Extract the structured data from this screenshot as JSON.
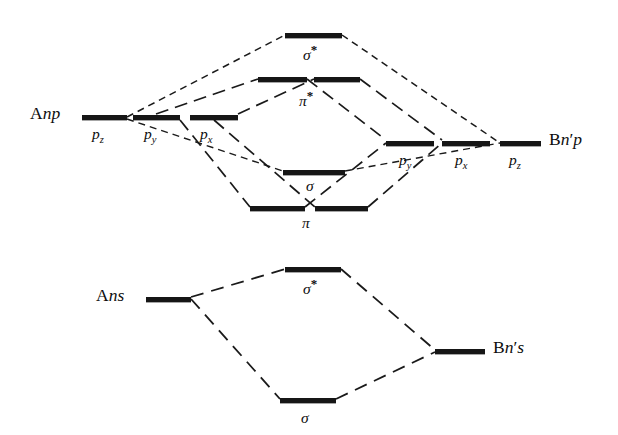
{
  "figure": {
    "type": "molecular-orbital-energy-level-diagram"
  },
  "diagram_p": {
    "left_atom_label": {
      "element": "A",
      "orbital": "np"
    },
    "right_atom_label": {
      "element": "B",
      "orbital": "n'p"
    },
    "left_orbitals": [
      {
        "name": "p_z",
        "label": "p",
        "sub": "z"
      },
      {
        "name": "p_y",
        "label": "p",
        "sub": "y"
      },
      {
        "name": "p_x",
        "label": "p",
        "sub": "x"
      }
    ],
    "right_orbitals": [
      {
        "name": "p_y",
        "label": "p",
        "sub": "y"
      },
      {
        "name": "p_x",
        "label": "p",
        "sub": "x"
      },
      {
        "name": "p_z",
        "label": "p",
        "sub": "z"
      }
    ],
    "molecular_orbitals": [
      {
        "name": "sigma-star",
        "label": "σ",
        "star": "*",
        "degeneracy": 1
      },
      {
        "name": "pi-star",
        "label": "π",
        "star": "*",
        "degeneracy": 2
      },
      {
        "name": "sigma",
        "label": "σ",
        "star": "",
        "degeneracy": 1
      },
      {
        "name": "pi",
        "label": "π",
        "star": "",
        "degeneracy": 2
      }
    ]
  },
  "diagram_s": {
    "left_atom_label": {
      "element": "A",
      "orbital": "ns"
    },
    "right_atom_label": {
      "element": "B",
      "orbital": "n's"
    },
    "molecular_orbitals": [
      {
        "name": "sigma-star",
        "label": "σ",
        "star": "*"
      },
      {
        "name": "sigma",
        "label": "σ",
        "star": ""
      }
    ]
  },
  "text": {
    "A": "A",
    "B": "B",
    "np": "np",
    "n_prime_p": "n",
    "n_prime_p_tail": "p",
    "ns": "ns",
    "n_prime_s_tail": "s",
    "prime": "′",
    "p": "p",
    "sub_x": "x",
    "sub_y": "y",
    "sub_z": "z",
    "sigma": "σ",
    "pi": "π",
    "star": "*"
  },
  "colors": {
    "level_bar": "#161616",
    "line": "#1a1a1a",
    "background": "#ffffff",
    "text": "#0d0d0d"
  },
  "geometry": {
    "width": 618,
    "height": 435,
    "p_levels": {
      "A_pz": {
        "x": 82,
        "y": 115,
        "w": 45
      },
      "A_py": {
        "x": 133,
        "y": 115,
        "w": 47
      },
      "A_px": {
        "x": 190,
        "y": 115,
        "w": 48
      },
      "sigma_star": {
        "x": 285,
        "y": 33,
        "w": 57
      },
      "pi_star_a": {
        "x": 258,
        "y": 77,
        "w": 49
      },
      "pi_star_b": {
        "x": 314,
        "y": 77,
        "w": 46
      },
      "sigma": {
        "x": 283,
        "y": 170,
        "w": 62
      },
      "pi_a": {
        "x": 250,
        "y": 206,
        "w": 55
      },
      "pi_b": {
        "x": 315,
        "y": 206,
        "w": 53
      },
      "B_py": {
        "x": 386,
        "y": 141,
        "w": 48
      },
      "B_px": {
        "x": 442,
        "y": 141,
        "w": 48
      },
      "B_pz": {
        "x": 500,
        "y": 141,
        "w": 41
      }
    },
    "s_levels": {
      "A_ns": {
        "x": 146,
        "y": 297,
        "w": 45
      },
      "sigma_star": {
        "x": 285,
        "y": 267,
        "w": 56
      },
      "sigma": {
        "x": 280,
        "y": 398,
        "w": 56
      },
      "B_ns": {
        "x": 435,
        "y": 349,
        "w": 50
      }
    }
  }
}
